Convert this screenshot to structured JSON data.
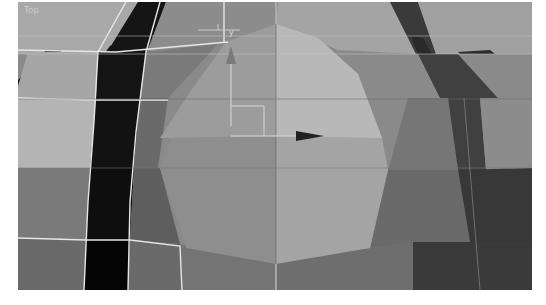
{
  "viewport": {
    "label": "Top",
    "view": "top-orthographic",
    "gizmo": {
      "y_axis_label": "y",
      "x_axis_icon": "arrow-right-icon",
      "y_axis_icon": "arrow-up-icon"
    },
    "colors": {
      "background": "#8a8a8a",
      "grid_line": "#c8c8c8",
      "selected_face_light": "#b4b4b4",
      "selected_face_mid": "#a2a2a2",
      "selected_face_dark": "#8e8e8e",
      "dark_strip": "#1a1a1a",
      "edge_white": "#e8e8e8"
    }
  }
}
